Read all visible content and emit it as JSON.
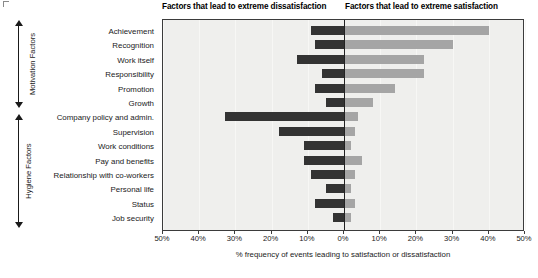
{
  "headers": {
    "left": "Factors that lead to extreme dissatisfaction",
    "right": "Factors that lead to extreme satisfaction"
  },
  "groups": [
    {
      "label": "Motivation Factors",
      "name": "motivation-factors"
    },
    {
      "label": "Hygiene Factors",
      "name": "hygiene-factors"
    }
  ],
  "axis": {
    "xlabel": "% frequency of events leading to satisfaction or dissatisfaction",
    "ticks": [
      "50%",
      "40%",
      "30%",
      "20%",
      "10%",
      "0%",
      "10%",
      "20%",
      "30%",
      "40%",
      "50%"
    ]
  },
  "colors": {
    "dissatisfaction_bar": "#333333",
    "satisfaction_bar": "#a5a5a5",
    "plot_background": "#efefed",
    "zero_line": "#222222"
  },
  "chart_data": {
    "type": "bar",
    "title": "",
    "subtitle": "",
    "orientation": "horizontal",
    "layout": "diverging",
    "xlabel": "% frequency of events leading to satisfaction or dissatisfaction",
    "ylabel": "",
    "xlim": [
      -50,
      50
    ],
    "xticks": [
      -50,
      -40,
      -30,
      -20,
      -10,
      0,
      10,
      20,
      30,
      40,
      50
    ],
    "xtick_labels": [
      "50%",
      "40%",
      "30%",
      "20%",
      "10%",
      "0%",
      "10%",
      "20%",
      "30%",
      "40%",
      "50%"
    ],
    "grid": true,
    "legend": false,
    "categories": [
      "Achievement",
      "Recognition",
      "Work itself",
      "Responsibility",
      "Promotion",
      "Growth",
      "Company policy and admin.",
      "Supervision",
      "Work conditions",
      "Pay and benefits",
      "Relationship with co-workers",
      "Personal life",
      "Status",
      "Job security"
    ],
    "groups": {
      "Motivation Factors": [
        "Achievement",
        "Recognition",
        "Work itself",
        "Responsibility",
        "Promotion",
        "Growth"
      ],
      "Hygiene Factors": [
        "Company policy and admin.",
        "Supervision",
        "Work conditions",
        "Pay and benefits",
        "Relationship with co-workers",
        "Personal life",
        "Status",
        "Job security"
      ]
    },
    "series": [
      {
        "name": "Factors that lead to extreme dissatisfaction",
        "color": "#333333",
        "direction": "left",
        "values": [
          9,
          8,
          13,
          6,
          8,
          5,
          33,
          18,
          11,
          11,
          9,
          5,
          8,
          3
        ]
      },
      {
        "name": "Factors that lead to extreme satisfaction",
        "color": "#a5a5a5",
        "direction": "right",
        "values": [
          40,
          30,
          22,
          22,
          14,
          8,
          4,
          3,
          2,
          5,
          3,
          2,
          3,
          2
        ]
      }
    ]
  }
}
